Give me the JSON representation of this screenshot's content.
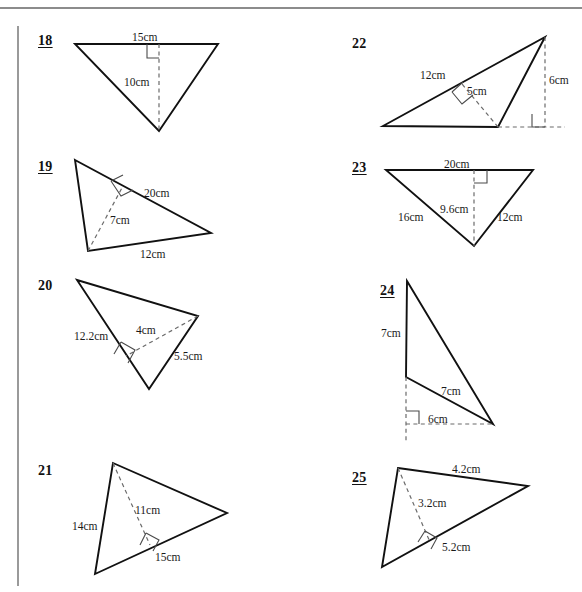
{
  "page": {
    "top_rule_color": "#8c8c8c",
    "left_rule_color": "#9a9a9a",
    "stroke_color": "#111111",
    "dashed_color": "#6b6b6b",
    "unit": "cm"
  },
  "problems": [
    {
      "number": "18",
      "underlined": true,
      "column": "left",
      "shape": "triangle",
      "orientation": "inverted",
      "labels": [
        {
          "name": "base-label",
          "text": "15cm"
        },
        {
          "name": "height-label",
          "text": "10cm"
        }
      ],
      "measurements": {
        "base": 15,
        "height": 10
      },
      "right_angle_marker": true
    },
    {
      "number": "19",
      "underlined": true,
      "column": "left",
      "shape": "triangle",
      "orientation": "scalene-right-leaning",
      "labels": [
        {
          "name": "side-label",
          "text": "20cm"
        },
        {
          "name": "height-label",
          "text": "7cm"
        },
        {
          "name": "base-label",
          "text": "12cm"
        }
      ],
      "measurements": {
        "side": 20,
        "height": 7,
        "base": 12
      },
      "right_angle_marker": true
    },
    {
      "number": "20",
      "underlined": false,
      "column": "left",
      "shape": "triangle",
      "orientation": "scalene-down-point",
      "labels": [
        {
          "name": "side-label",
          "text": "12.2cm"
        },
        {
          "name": "height-label",
          "text": "4cm"
        },
        {
          "name": "base-label",
          "text": "5.5cm"
        }
      ],
      "measurements": {
        "side": 12.2,
        "height": 4,
        "base": 5.5
      },
      "right_angle_marker": true
    },
    {
      "number": "21",
      "underlined": false,
      "column": "left",
      "shape": "triangle",
      "orientation": "scalene-right-pointing",
      "labels": [
        {
          "name": "side-label",
          "text": "14cm"
        },
        {
          "name": "height-label",
          "text": "11cm"
        },
        {
          "name": "base-label",
          "text": "15cm"
        }
      ],
      "measurements": {
        "side": 14,
        "height": 11,
        "base": 15
      },
      "right_angle_marker": true
    },
    {
      "number": "22",
      "underlined": false,
      "column": "right",
      "shape": "triangle",
      "orientation": "obtuse-with-external-height",
      "labels": [
        {
          "name": "side-label",
          "text": "12cm"
        },
        {
          "name": "height-label",
          "text": "5cm"
        },
        {
          "name": "external-height-label",
          "text": "6cm"
        }
      ],
      "measurements": {
        "side": 12,
        "height": 5,
        "external_height": 6
      },
      "right_angle_marker": true
    },
    {
      "number": "23",
      "underlined": true,
      "column": "right",
      "shape": "triangle",
      "orientation": "inverted",
      "labels": [
        {
          "name": "base-label",
          "text": "20cm"
        },
        {
          "name": "height-label",
          "text": "9.6cm"
        },
        {
          "name": "left-side-label",
          "text": "16cm"
        },
        {
          "name": "right-side-label",
          "text": "12cm"
        }
      ],
      "measurements": {
        "base": 20,
        "height": 9.6,
        "left_side": 16,
        "right_side": 12
      },
      "right_angle_marker": true
    },
    {
      "number": "24",
      "underlined": true,
      "column": "right",
      "shape": "triangle",
      "orientation": "obtuse-with-external-base",
      "labels": [
        {
          "name": "side-label",
          "text": "7cm"
        },
        {
          "name": "base-label",
          "text": "7cm"
        },
        {
          "name": "external-base-label",
          "text": "6cm"
        }
      ],
      "measurements": {
        "side": 7,
        "base": 7,
        "external_base": 6
      },
      "right_angle_marker": true
    },
    {
      "number": "25",
      "underlined": true,
      "column": "right",
      "shape": "triangle",
      "orientation": "scalene-right-pointing",
      "labels": [
        {
          "name": "top-side-label",
          "text": "4.2cm"
        },
        {
          "name": "height-label",
          "text": "3.2cm"
        },
        {
          "name": "base-label",
          "text": "5.2cm"
        }
      ],
      "measurements": {
        "top_side": 4.2,
        "height": 3.2,
        "base": 5.2
      },
      "right_angle_marker": true
    }
  ]
}
